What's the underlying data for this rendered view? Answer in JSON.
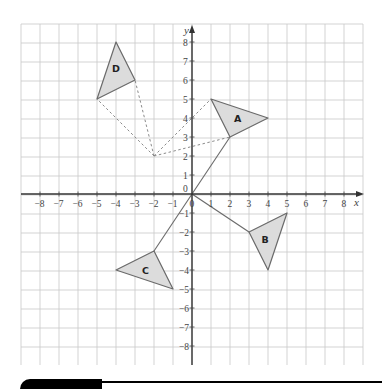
{
  "diagram": {
    "axes": {
      "x_label": "x",
      "y_label": "y",
      "x_range": [
        -8,
        8
      ],
      "y_range": [
        -8,
        8
      ],
      "x_ticks": [
        "−8",
        "−7",
        "−6",
        "−5",
        "−4",
        "−3",
        "−2",
        "−1",
        "0",
        "1",
        "2",
        "3",
        "4",
        "5",
        "6",
        "7",
        "8"
      ],
      "y_ticks": [
        "8",
        "7",
        "6",
        "5",
        "4",
        "3",
        "2",
        "1",
        "0",
        "−1",
        "−2",
        "−3",
        "−4",
        "−5",
        "−6",
        "−7",
        "−8"
      ],
      "origin_label": "0"
    },
    "shapes": [
      {
        "label": "A",
        "vertices": [
          [
            1,
            5
          ],
          [
            4,
            4
          ],
          [
            2,
            3
          ]
        ],
        "label_pos": [
          2.4,
          4
        ]
      },
      {
        "label": "B",
        "vertices": [
          [
            3,
            -2
          ],
          [
            5,
            -1
          ],
          [
            4,
            -4
          ]
        ],
        "label_pos": [
          3.85,
          -2.4
        ]
      },
      {
        "label": "C",
        "vertices": [
          [
            -2,
            -3
          ],
          [
            -4,
            -4
          ],
          [
            -1,
            -5
          ]
        ],
        "label_pos": [
          -2.45,
          -4.05
        ]
      },
      {
        "label": "D",
        "vertices": [
          [
            -4,
            8
          ],
          [
            -3,
            6
          ],
          [
            -5,
            5
          ]
        ],
        "label_pos": [
          -4,
          6.6
        ]
      }
    ],
    "solid_lines": [
      {
        "from": [
          0,
          0
        ],
        "to": [
          2,
          3
        ]
      },
      {
        "from": [
          0,
          0
        ],
        "to": [
          3,
          -2
        ]
      },
      {
        "from": [
          0,
          0
        ],
        "to": [
          -2,
          -3
        ]
      }
    ],
    "dashed_lines": [
      {
        "from": [
          -2,
          2
        ],
        "to": [
          1,
          5
        ]
      },
      {
        "from": [
          -2,
          2
        ],
        "to": [
          2,
          3
        ]
      },
      {
        "from": [
          -2,
          2
        ],
        "to": [
          -3,
          6
        ]
      },
      {
        "from": [
          -2,
          2
        ],
        "to": [
          -5,
          5
        ]
      }
    ],
    "colors": {
      "shape_fill": "#dcdcdc",
      "shape_stroke": "#6a6a6a",
      "grid": "#c8c8c8",
      "axis": "#333333"
    }
  }
}
